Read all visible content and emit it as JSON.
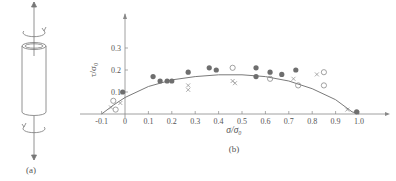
{
  "figure": {
    "panel_a_label": "(a)",
    "panel_b_label": "(b)",
    "panel_a_description": "Thin-walled tube under axial tension and torsion"
  },
  "chart_data": {
    "type": "scatter",
    "title": "",
    "xlabel": "σ/σ₀",
    "ylabel": "τ/σ₀",
    "xlim": [
      -0.1,
      1.05
    ],
    "ylim": [
      0,
      0.35
    ],
    "xticks": [
      -0.1,
      0,
      0.1,
      0.2,
      0.3,
      0.4,
      0.5,
      0.6,
      0.7,
      0.8,
      0.9,
      1.0
    ],
    "xtick_labels": [
      "-0.1",
      "0",
      "0.1",
      "0.2",
      "0.3",
      "0.4",
      "0.5",
      "0.6",
      "0.7",
      "0.8",
      "0.9",
      "1.0"
    ],
    "yticks": [
      0.1,
      0.2,
      0.3
    ],
    "ytick_labels": [
      "0.1",
      "0.2",
      "0.3"
    ],
    "grid": false,
    "legend": "none",
    "series": [
      {
        "name": "filled circles",
        "marker": "filled-circle",
        "points": [
          [
            -0.01,
            0.1
          ],
          [
            0.12,
            0.17
          ],
          [
            0.15,
            0.15
          ],
          [
            0.18,
            0.15
          ],
          [
            0.2,
            0.15
          ],
          [
            0.27,
            0.19
          ],
          [
            0.36,
            0.21
          ],
          [
            0.39,
            0.2
          ],
          [
            0.56,
            0.21
          ],
          [
            0.56,
            0.17
          ],
          [
            0.62,
            0.19
          ],
          [
            0.67,
            0.18
          ],
          [
            0.73,
            0.2
          ],
          [
            0.99,
            0.01
          ]
        ]
      },
      {
        "name": "open circles",
        "marker": "open-circle",
        "points": [
          [
            -0.05,
            0.06
          ],
          [
            -0.04,
            0.02
          ],
          [
            0.46,
            0.21
          ],
          [
            0.62,
            0.16
          ],
          [
            0.74,
            0.13
          ],
          [
            0.85,
            0.19
          ],
          [
            0.85,
            0.13
          ]
        ]
      },
      {
        "name": "crosses",
        "marker": "x",
        "points": [
          [
            -0.02,
            0.05
          ],
          [
            -0.06,
            0.03
          ],
          [
            0.27,
            0.13
          ],
          [
            0.27,
            0.11
          ],
          [
            0.46,
            0.15
          ],
          [
            0.47,
            0.14
          ],
          [
            0.72,
            0.16
          ],
          [
            0.82,
            0.18
          ],
          [
            0.95,
            0.02
          ]
        ]
      },
      {
        "name": "fit curve",
        "marker": "line",
        "points": [
          [
            -0.1,
            0.0
          ],
          [
            -0.05,
            0.04
          ],
          [
            0.0,
            0.075
          ],
          [
            0.1,
            0.125
          ],
          [
            0.2,
            0.155
          ],
          [
            0.3,
            0.17
          ],
          [
            0.4,
            0.178
          ],
          [
            0.5,
            0.178
          ],
          [
            0.6,
            0.17
          ],
          [
            0.7,
            0.15
          ],
          [
            0.8,
            0.115
          ],
          [
            0.9,
            0.065
          ],
          [
            0.97,
            0.01
          ],
          [
            1.0,
            0.0
          ]
        ]
      }
    ]
  },
  "colors": {
    "axis": "#888888",
    "curve": "#7a7a7a",
    "filled_marker": "#6e6e6e",
    "open_marker": "#8a8a8a",
    "text": "#555555"
  }
}
